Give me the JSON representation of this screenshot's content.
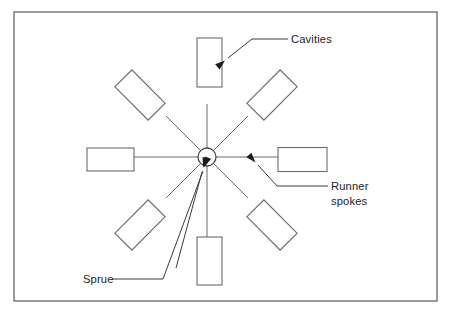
{
  "figure": {
    "background_color": "#ffffff",
    "line_color": "#6b6b6b",
    "text_color": "#1c1c1c",
    "frame_color": "#5a5a5a"
  },
  "labels": {
    "cavities": {
      "text": "Cavities",
      "x": 291,
      "y": 43
    },
    "runner_spokes": {
      "line1": "Runner",
      "line2": "spokes",
      "x": 331,
      "y": 190,
      "line2_y": 205
    },
    "sprue": {
      "text": "Sprue",
      "x": 83,
      "y": 283
    }
  },
  "sprue_hub": {
    "name": "sprue",
    "cx": 207,
    "cy": 157,
    "r": 9
  },
  "spokes": [
    {
      "name": "spoke-n",
      "angle": -90,
      "inner": 9,
      "outer": 53
    },
    {
      "name": "spoke-ne",
      "angle": -45,
      "inner": 9,
      "outer": 58
    },
    {
      "name": "spoke-e",
      "angle": 0,
      "inner": 9,
      "outer": 71
    },
    {
      "name": "spoke-se",
      "angle": 45,
      "inner": 9,
      "outer": 58
    },
    {
      "name": "spoke-s",
      "angle": 90,
      "inner": 9,
      "outer": 80
    },
    {
      "name": "spoke-sw",
      "angle": 135,
      "inner": 9,
      "outer": 58
    },
    {
      "name": "spoke-w",
      "angle": 180,
      "inner": 9,
      "outer": 73
    },
    {
      "name": "spoke-nw",
      "angle": -135,
      "inner": 9,
      "outer": 58
    }
  ],
  "cavities": [
    {
      "name": "cavity-n",
      "cx": 209.5,
      "cy": 62.5,
      "w": 25,
      "h": 49,
      "rot": 0
    },
    {
      "name": "cavity-ne",
      "cx": 272,
      "cy": 95,
      "w": 47,
      "h": 24,
      "rot": -45
    },
    {
      "name": "cavity-e",
      "cx": 302.5,
      "cy": 159.5,
      "w": 49,
      "h": 24,
      "rot": 0
    },
    {
      "name": "cavity-se",
      "cx": 272,
      "cy": 225,
      "w": 47,
      "h": 24,
      "rot": 45
    },
    {
      "name": "cavity-s",
      "cx": 209.5,
      "cy": 261,
      "w": 25,
      "h": 48,
      "rot": 0
    },
    {
      "name": "cavity-sw",
      "cx": 140,
      "cy": 225,
      "w": 47,
      "h": 24,
      "rot": -45
    },
    {
      "name": "cavity-w",
      "cx": 110.5,
      "cy": 159.5,
      "w": 47,
      "h": 23,
      "rot": 0
    },
    {
      "name": "cavity-nw",
      "cx": 140,
      "cy": 95,
      "w": 47,
      "h": 24,
      "rot": 45
    }
  ],
  "frame": {
    "x": 14,
    "y": 12,
    "width": 423,
    "height": 289
  },
  "leaders": {
    "cavities": {
      "path": "M 288 39 L 252 39 L 228 58",
      "arrow_tip": {
        "x": 225,
        "y": 60.5
      },
      "arrow_angle": 140
    },
    "runner_spokes": {
      "path": "M 328 186 L 277 186 L 258 165",
      "arrow_tip": {
        "x": 255.5,
        "y": 162.5
      },
      "arrow_angle": 228
    },
    "sprue": {
      "path": "M 112 279 L 163 279 L 203 171",
      "arrow_tip": {
        "x": 204.5,
        "y": 167
      },
      "arrow_angle": 290
    },
    "sprue_second": {
      "path": "M 176 268 L 202 172",
      "arrow_tip": {
        "x": 203.2,
        "y": 167.5
      },
      "arrow_angle": 285
    }
  }
}
